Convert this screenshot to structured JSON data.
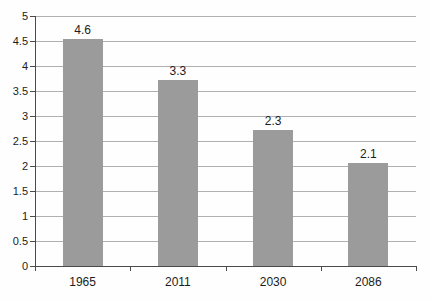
{
  "chart_style": {
    "background_color": "#fefefe",
    "bar_color": "#9b9b9b",
    "gridline_color": "#b0b0b0",
    "axis_color": "#4a4a4a",
    "text_color": "#1c1c1c"
  },
  "chart_data": {
    "type": "bar",
    "title": "",
    "xlabel": "",
    "ylabel": "",
    "categories": [
      "1965",
      "2011",
      "2030",
      "2086"
    ],
    "values": [
      4.6,
      3.3,
      2.3,
      2.1
    ],
    "data_labels": [
      "4.6",
      "3.3",
      "2.3",
      "2.1"
    ],
    "drawn_bar_heights": [
      4.55,
      3.72,
      2.72,
      2.06
    ],
    "ylim": [
      0,
      5
    ],
    "ytick_step": 0.5,
    "ytick_labels": [
      "5",
      "4.5",
      "4",
      "3.5",
      "3",
      "2.5",
      "2",
      "1.5",
      "1",
      "0.5",
      "0"
    ],
    "grid": true,
    "legend": false,
    "data_labels_position": "above-bar"
  }
}
